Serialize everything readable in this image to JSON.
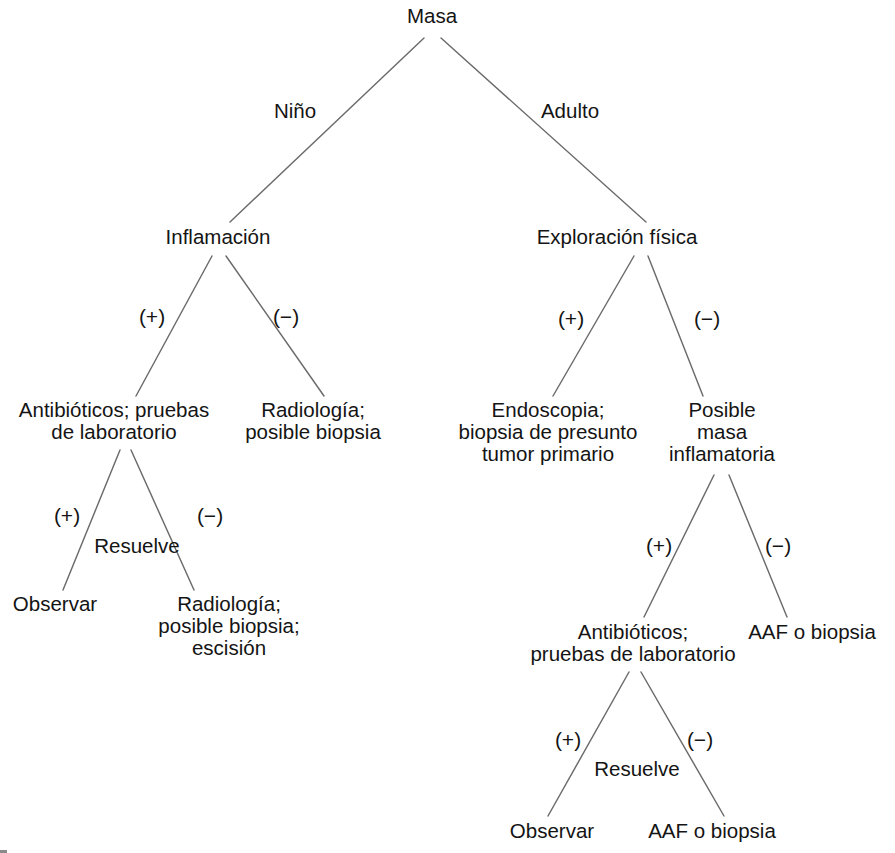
{
  "diagram": {
    "title": "Masa",
    "type": "decision-tree",
    "language": "es",
    "line_color": "#6b6b6b",
    "text_color": "#141414",
    "background_color": "#ffffff",
    "nodes": [
      {
        "id": "root",
        "lines": [
          "Masa"
        ],
        "x": 432,
        "y": 18
      },
      {
        "id": "inflamacion",
        "lines": [
          "Inflamación"
        ],
        "x": 218,
        "y": 239
      },
      {
        "id": "exploracion",
        "lines": [
          "Exploración física"
        ],
        "x": 617,
        "y": 239
      },
      {
        "id": "antibioticos-1",
        "lines": [
          "Antibióticos; pruebas",
          "de laboratorio"
        ],
        "x": 114,
        "y": 412
      },
      {
        "id": "radiologia-1",
        "lines": [
          "Radiología;",
          "posible biopsia"
        ],
        "x": 313,
        "y": 412
      },
      {
        "id": "endoscopia",
        "lines": [
          "Endoscopia;",
          "biopsia de presunto",
          "tumor primario"
        ],
        "x": 548,
        "y": 412
      },
      {
        "id": "posible-masa",
        "lines": [
          "Posible",
          "masa",
          "inflamatoria"
        ],
        "x": 722,
        "y": 412
      },
      {
        "id": "observar-1",
        "lines": [
          "Observar"
        ],
        "x": 55,
        "y": 606
      },
      {
        "id": "radiologia-2",
        "lines": [
          "Radiología;",
          "posible biopsia;",
          "escisión"
        ],
        "x": 229,
        "y": 606
      },
      {
        "id": "antibioticos-2",
        "lines": [
          "Antibióticos;",
          "pruebas de laboratorio"
        ],
        "x": 633,
        "y": 634
      },
      {
        "id": "aaf-1",
        "lines": [
          "AAF o biopsia"
        ],
        "x": 812,
        "y": 634
      },
      {
        "id": "observar-2",
        "lines": [
          "Observar"
        ],
        "x": 552,
        "y": 833
      },
      {
        "id": "aaf-2",
        "lines": [
          "AAF o biopsia"
        ],
        "x": 712,
        "y": 833
      }
    ],
    "edges": [
      {
        "id": "root-nino",
        "from": "root",
        "to": "inflamacion",
        "label": "Niño",
        "label_x": 295,
        "label_y": 113,
        "x1": 424,
        "y1": 38,
        "x2": 230,
        "y2": 222
      },
      {
        "id": "root-adulto",
        "from": "root",
        "to": "exploracion",
        "label": "Adulto",
        "label_x": 570,
        "label_y": 113,
        "x1": 441,
        "y1": 38,
        "x2": 646,
        "y2": 222
      },
      {
        "id": "infl-pos",
        "from": "inflamacion",
        "to": "antibioticos-1",
        "label": "(+)",
        "label_x": 152,
        "label_y": 318,
        "x1": 212,
        "y1": 256,
        "x2": 136,
        "y2": 396
      },
      {
        "id": "infl-neg",
        "from": "inflamacion",
        "to": "radiologia-1",
        "label": "(−)",
        "label_x": 286,
        "label_y": 318,
        "x1": 226,
        "y1": 256,
        "x2": 324,
        "y2": 396
      },
      {
        "id": "expl-pos",
        "from": "exploracion",
        "to": "endoscopia",
        "label": "(+)",
        "label_x": 571,
        "label_y": 320,
        "x1": 634,
        "y1": 256,
        "x2": 553,
        "y2": 396
      },
      {
        "id": "expl-neg",
        "from": "exploracion",
        "to": "posible-masa",
        "label": "(−)",
        "label_x": 707,
        "label_y": 320,
        "x1": 648,
        "y1": 256,
        "x2": 703,
        "y2": 396
      },
      {
        "id": "anti1-pos",
        "from": "antibioticos-1",
        "to": "observar-1",
        "label": "(+)",
        "label_x": 67,
        "label_y": 517,
        "x1": 120,
        "y1": 450,
        "x2": 63,
        "y2": 590
      },
      {
        "id": "anti1-neg",
        "from": "antibioticos-1",
        "to": "radiologia-2",
        "label": "(−)",
        "label_x": 210,
        "label_y": 517,
        "x1": 131,
        "y1": 450,
        "x2": 194,
        "y2": 590
      },
      {
        "id": "posmasa-pos",
        "from": "posible-masa",
        "to": "antibioticos-2",
        "label": "(+)",
        "label_x": 659,
        "label_y": 547,
        "x1": 714,
        "y1": 475,
        "x2": 644,
        "y2": 617
      },
      {
        "id": "posmasa-neg",
        "from": "posible-masa",
        "to": "aaf-1",
        "label": "(−)",
        "label_x": 778,
        "label_y": 547,
        "x1": 729,
        "y1": 475,
        "x2": 787,
        "y2": 617
      },
      {
        "id": "anti2-pos",
        "from": "antibioticos-2",
        "to": "observar-2",
        "label": "(+)",
        "label_x": 568,
        "label_y": 741,
        "x1": 629,
        "y1": 672,
        "x2": 548,
        "y2": 816
      },
      {
        "id": "anti2-neg",
        "from": "antibioticos-2",
        "to": "aaf-2",
        "label": "(−)",
        "label_x": 700,
        "label_y": 741,
        "x1": 641,
        "y1": 672,
        "x2": 724,
        "y2": 816
      }
    ],
    "annotations": [
      {
        "id": "resuelve-left",
        "text": "Resuelve",
        "x": 137,
        "y": 548
      },
      {
        "id": "resuelve-right",
        "text": "Resuelve",
        "x": 637,
        "y": 771
      }
    ]
  }
}
